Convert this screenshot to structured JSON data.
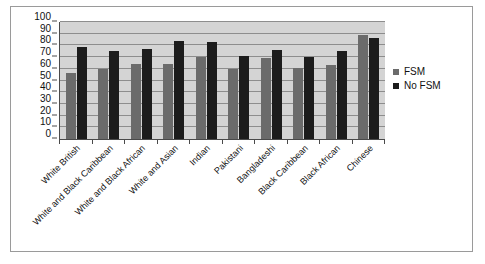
{
  "figure": {
    "border_color": "#9a9a9a",
    "plot_background": "#d4d4d4"
  },
  "legend": {
    "position": "right",
    "entries": [
      {
        "label": "FSM",
        "color": "#6b6b6b",
        "swatch_name": "legend-swatch-fsm"
      },
      {
        "label": "No FSM",
        "color": "#1c1c1c",
        "swatch_name": "legend-swatch-no-fsm"
      }
    ]
  },
  "chart_data": {
    "type": "bar",
    "title": "",
    "xlabel": "",
    "ylabel": "",
    "ylim": [
      0,
      100
    ],
    "yticks": [
      0,
      10,
      20,
      30,
      40,
      50,
      60,
      70,
      80,
      90,
      100
    ],
    "ytick_labels": [
      "0",
      "10",
      "20",
      "30",
      "40",
      "50",
      "60",
      "70",
      "80",
      "90",
      "100"
    ],
    "grid": true,
    "legend_position": "right",
    "categories": [
      "White British",
      "White and Black Caribbean",
      "White and Black African",
      "White and Asian",
      "Indian",
      "Pakistani",
      "Bangladeshi",
      "Black Caribbean",
      "Black African",
      "Chinese"
    ],
    "series": [
      {
        "name": "FSM",
        "color": "#6b6b6b",
        "values": [
          56,
          60,
          64,
          64,
          70,
          60,
          69,
          61,
          63,
          89
        ]
      },
      {
        "name": "No FSM",
        "color": "#1c1c1c",
        "values": [
          79,
          75,
          77,
          84,
          83,
          71,
          76,
          70,
          75,
          86
        ]
      }
    ]
  }
}
